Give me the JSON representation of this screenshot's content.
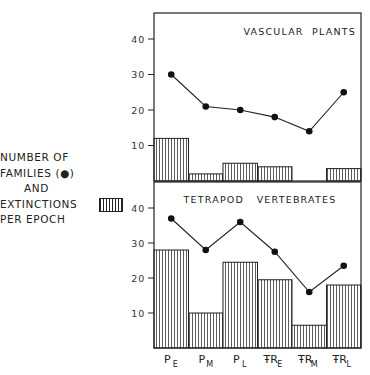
{
  "legend": {
    "line1": "NUMBER OF",
    "line2": "FAMILIES (●)",
    "line3": "AND",
    "line4": "EXTINCTIONS",
    "line5": "PER EPOCH"
  },
  "chart_data": [
    {
      "type": "bar+line",
      "title": "VASCULAR PLANTS",
      "categories": [
        "P_E",
        "P_M",
        "P_L",
        "TR_E",
        "TR_M",
        "TR_L"
      ],
      "category_labels": [
        {
          "main": "P",
          "sub": "E"
        },
        {
          "main": "P",
          "sub": "M"
        },
        {
          "main": "P",
          "sub": "L"
        },
        {
          "main": "ŦR",
          "sub": "E"
        },
        {
          "main": "ŦR",
          "sub": "M"
        },
        {
          "main": "ŦR",
          "sub": "L"
        }
      ],
      "series": [
        {
          "name": "Number of families",
          "type": "line",
          "marker": "dot",
          "values": [
            30,
            21,
            20,
            18,
            14,
            25
          ]
        },
        {
          "name": "Extinctions per epoch",
          "type": "bar",
          "pattern": "vertical-hatch",
          "values": [
            12,
            2,
            5,
            4,
            0,
            3.5
          ]
        }
      ],
      "yticks": [
        10,
        20,
        30,
        40
      ],
      "ylim": [
        0,
        48
      ],
      "grid": false
    },
    {
      "type": "bar+line",
      "title": "TETRAPOD VERTEBRATES",
      "categories": [
        "P_E",
        "P_M",
        "P_L",
        "TR_E",
        "TR_M",
        "TR_L"
      ],
      "series": [
        {
          "name": "Number of families",
          "type": "line",
          "marker": "dot",
          "values": [
            37,
            28,
            36,
            27.5,
            16,
            23.5
          ]
        },
        {
          "name": "Extinctions per epoch",
          "type": "bar",
          "pattern": "vertical-hatch",
          "values": [
            28,
            10,
            24.5,
            19.5,
            6.5,
            18
          ]
        }
      ],
      "yticks": [
        10,
        20,
        30,
        40
      ],
      "ylim": [
        0,
        47
      ],
      "grid": false
    }
  ]
}
